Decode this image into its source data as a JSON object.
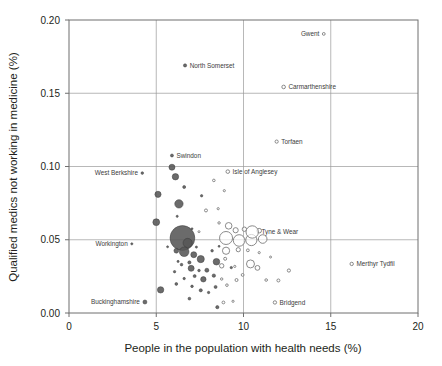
{
  "chart_data": {
    "type": "scatter",
    "title": "",
    "xlabel": "People in the population with health needs (%)",
    "ylabel": "Qualified medics not working in medicine (%)",
    "xlim": [
      0,
      20
    ],
    "ylim": [
      0,
      0.2
    ],
    "xticks": [
      "0",
      "5",
      "10",
      "15",
      "20"
    ],
    "xtick_values": [
      0,
      5,
      10,
      15,
      20
    ],
    "yticks": [
      "0.00",
      "0.05",
      "0.10",
      "0.15",
      "0.20"
    ],
    "ytick_values": [
      0,
      0.05,
      0.1,
      0.15,
      0.2
    ],
    "grid": "both",
    "legend": "none",
    "series": [
      {
        "name": "filled",
        "marker": "filled-circle",
        "color": "#565656",
        "points": [
          {
            "x": 14.6,
            "y": 0.1905,
            "r": 1.4,
            "label": "Gwent",
            "label_side": "left",
            "style": "hollow"
          },
          {
            "x": 6.65,
            "y": 0.169,
            "r": 1.6,
            "label": "North Somerset",
            "label_side": "right",
            "style": "filled"
          },
          {
            "x": 12.3,
            "y": 0.1543,
            "r": 1.8,
            "label": "Carmarthenshire",
            "label_side": "right",
            "style": "hollow"
          },
          {
            "x": 11.9,
            "y": 0.117,
            "r": 1.6,
            "label": "Torfaen",
            "label_side": "right",
            "style": "hollow"
          },
          {
            "x": 5.9,
            "y": 0.1075,
            "r": 1.5,
            "label": "Swindon",
            "label_side": "right",
            "style": "filled"
          },
          {
            "x": 4.2,
            "y": 0.0955,
            "r": 1.3,
            "label": "West Berkshire",
            "label_side": "left",
            "style": "filled"
          },
          {
            "x": 9.1,
            "y": 0.0965,
            "r": 1.8,
            "label": "Isle of Anglesey",
            "label_side": "right",
            "style": "hollow"
          },
          {
            "x": 10.5,
            "y": 0.0553,
            "r": 6.2,
            "label": "Tyne & Wear",
            "label_side": "right",
            "style": "hollow"
          },
          {
            "x": 16.2,
            "y": 0.0335,
            "r": 1.7,
            "label": "Merthyr Tydfil",
            "label_side": "right",
            "style": "hollow"
          },
          {
            "x": 3.6,
            "y": 0.0472,
            "r": 1.1,
            "label": "Workington",
            "label_side": "left",
            "style": "filled"
          },
          {
            "x": 4.35,
            "y": 0.0075,
            "r": 2.0,
            "label": "Buckinghamshire",
            "label_side": "left",
            "style": "filled"
          },
          {
            "x": 11.8,
            "y": 0.0072,
            "r": 1.7,
            "label": "Bridgend",
            "label_side": "right",
            "style": "hollow"
          }
        ]
      }
    ],
    "unlabeled_filled": [
      {
        "x": 5.9,
        "y": 0.0995,
        "r": 3.0
      },
      {
        "x": 6.1,
        "y": 0.093,
        "r": 3.2
      },
      {
        "x": 5.1,
        "y": 0.081,
        "r": 3.1
      },
      {
        "x": 6.3,
        "y": 0.0745,
        "r": 4.2
      },
      {
        "x": 6.6,
        "y": 0.086,
        "r": 1.5
      },
      {
        "x": 7.6,
        "y": 0.08,
        "r": 1.2
      },
      {
        "x": 5.0,
        "y": 0.062,
        "r": 3.4
      },
      {
        "x": 6.5,
        "y": 0.0512,
        "r": 12.4
      },
      {
        "x": 6.8,
        "y": 0.0478,
        "r": 4.6
      },
      {
        "x": 6.15,
        "y": 0.0425,
        "r": 2.4
      },
      {
        "x": 6.6,
        "y": 0.0418,
        "r": 4.8
      },
      {
        "x": 7.15,
        "y": 0.0398,
        "r": 3.0
      },
      {
        "x": 7.55,
        "y": 0.0368,
        "r": 3.6
      },
      {
        "x": 8.2,
        "y": 0.0425,
        "r": 1.3
      },
      {
        "x": 8.45,
        "y": 0.035,
        "r": 3.3
      },
      {
        "x": 6.9,
        "y": 0.0345,
        "r": 1.6
      },
      {
        "x": 6.45,
        "y": 0.033,
        "r": 1.3
      },
      {
        "x": 6.25,
        "y": 0.0352,
        "r": 1.1
      },
      {
        "x": 7.0,
        "y": 0.0305,
        "r": 3.0
      },
      {
        "x": 7.45,
        "y": 0.029,
        "r": 1.3
      },
      {
        "x": 7.9,
        "y": 0.0292,
        "r": 2.0
      },
      {
        "x": 7.2,
        "y": 0.0252,
        "r": 1.5
      },
      {
        "x": 7.7,
        "y": 0.023,
        "r": 2.7
      },
      {
        "x": 8.3,
        "y": 0.0255,
        "r": 1.7
      },
      {
        "x": 6.6,
        "y": 0.0235,
        "r": 1.2
      },
      {
        "x": 6.15,
        "y": 0.0198,
        "r": 1.4
      },
      {
        "x": 7.05,
        "y": 0.0182,
        "r": 1.3
      },
      {
        "x": 7.55,
        "y": 0.0155,
        "r": 1.6
      },
      {
        "x": 8.0,
        "y": 0.014,
        "r": 1.2
      },
      {
        "x": 8.4,
        "y": 0.0178,
        "r": 1.5
      },
      {
        "x": 5.25,
        "y": 0.0158,
        "r": 3.2
      },
      {
        "x": 6.9,
        "y": 0.0098,
        "r": 1.4
      },
      {
        "x": 8.5,
        "y": 0.004,
        "r": 1.6
      },
      {
        "x": 9.3,
        "y": 0.031,
        "r": 1.2
      },
      {
        "x": 6.2,
        "y": 0.066,
        "r": 1.1
      },
      {
        "x": 7.05,
        "y": 0.0575,
        "r": 1.0
      },
      {
        "x": 5.65,
        "y": 0.0452,
        "r": 1.0
      },
      {
        "x": 6.05,
        "y": 0.0282,
        "r": 1.2
      },
      {
        "x": 7.3,
        "y": 0.045,
        "r": 1.1
      },
      {
        "x": 8.6,
        "y": 0.0455,
        "r": 1.0
      }
    ],
    "unlabeled_hollow": [
      {
        "x": 9.15,
        "y": 0.0595,
        "r": 3.3
      },
      {
        "x": 9.55,
        "y": 0.0565,
        "r": 2.6
      },
      {
        "x": 10.05,
        "y": 0.0572,
        "r": 2.2
      },
      {
        "x": 9.0,
        "y": 0.0512,
        "r": 6.5
      },
      {
        "x": 9.75,
        "y": 0.0495,
        "r": 5.8
      },
      {
        "x": 10.45,
        "y": 0.0498,
        "r": 5.6
      },
      {
        "x": 11.1,
        "y": 0.0505,
        "r": 4.3
      },
      {
        "x": 10.9,
        "y": 0.0562,
        "r": 2.3
      },
      {
        "x": 9.0,
        "y": 0.0425,
        "r": 3.6
      },
      {
        "x": 9.7,
        "y": 0.0432,
        "r": 2.1
      },
      {
        "x": 8.95,
        "y": 0.037,
        "r": 1.5
      },
      {
        "x": 10.25,
        "y": 0.0428,
        "r": 1.4
      },
      {
        "x": 8.75,
        "y": 0.0322,
        "r": 2.2
      },
      {
        "x": 10.4,
        "y": 0.0335,
        "r": 4.0
      },
      {
        "x": 10.8,
        "y": 0.0308,
        "r": 2.4
      },
      {
        "x": 9.5,
        "y": 0.0318,
        "r": 1.1
      },
      {
        "x": 9.95,
        "y": 0.026,
        "r": 1.4
      },
      {
        "x": 12.6,
        "y": 0.029,
        "r": 1.6
      },
      {
        "x": 11.3,
        "y": 0.0225,
        "r": 1.3
      },
      {
        "x": 12.0,
        "y": 0.0222,
        "r": 1.5
      },
      {
        "x": 9.6,
        "y": 0.0225,
        "r": 1.5
      },
      {
        "x": 9.05,
        "y": 0.019,
        "r": 1.3
      },
      {
        "x": 8.75,
        "y": 0.0232,
        "r": 1.2
      },
      {
        "x": 8.85,
        "y": 0.0072,
        "r": 1.4
      },
      {
        "x": 9.4,
        "y": 0.008,
        "r": 1.1
      },
      {
        "x": 8.6,
        "y": 0.0615,
        "r": 1.2
      },
      {
        "x": 8.55,
        "y": 0.0712,
        "r": 1.1
      },
      {
        "x": 7.85,
        "y": 0.07,
        "r": 1.5
      },
      {
        "x": 8.3,
        "y": 0.0905,
        "r": 1.3
      },
      {
        "x": 8.9,
        "y": 0.0835,
        "r": 1.1
      },
      {
        "x": 7.45,
        "y": 0.0555,
        "r": 1.0
      },
      {
        "x": 10.9,
        "y": 0.0412,
        "r": 1.1
      },
      {
        "x": 11.55,
        "y": 0.0382,
        "r": 1.0
      }
    ]
  }
}
